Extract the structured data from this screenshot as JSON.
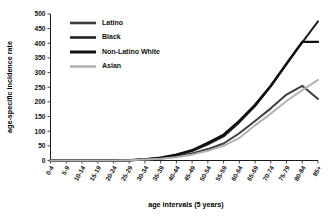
{
  "chart_data": {
    "type": "line",
    "title": "",
    "xlabel": "age intervals (5 years)",
    "ylabel": "age-specific incidence rate",
    "ylim": [
      0,
      500
    ],
    "ytick_step": 50,
    "yticks": [
      0,
      50,
      100,
      150,
      200,
      250,
      300,
      350,
      400,
      450,
      500
    ],
    "grid": false,
    "legend_position": "top-left-inside",
    "categories": [
      "0-4",
      "5-9",
      "10-14",
      "15-19",
      "20-24",
      "25-29",
      "30-34",
      "35-39",
      "40-44",
      "45-49",
      "50-54",
      "55-59",
      "60-64",
      "65-69",
      "70-74",
      "75-79",
      "80-84",
      "85+"
    ],
    "series": [
      {
        "name": "Latino",
        "color": "#3d3d3d",
        "width": 2.0,
        "values": [
          0,
          0,
          0,
          0,
          0,
          1,
          3,
          7,
          13,
          24,
          39,
          58,
          93,
          135,
          178,
          225,
          255,
          210
        ]
      },
      {
        "name": "Black",
        "color": "#1f1f1f",
        "width": 2.0,
        "values": [
          0,
          0,
          0,
          0,
          0,
          1,
          4,
          9,
          18,
          32,
          55,
          82,
          130,
          186,
          253,
          330,
          403,
          475
        ]
      },
      {
        "name": "Non-Latino White",
        "color": "#111111",
        "width": 2.4,
        "values": [
          0,
          0,
          0,
          0,
          0,
          1,
          4,
          10,
          20,
          35,
          60,
          88,
          135,
          190,
          255,
          330,
          405,
          405
        ]
      },
      {
        "name": "Asian",
        "color": "#b3b3b3",
        "width": 2.0,
        "values": [
          0,
          0,
          0,
          0,
          0,
          1,
          3,
          6,
          11,
          20,
          33,
          50,
          77,
          120,
          160,
          203,
          240,
          275
        ]
      }
    ]
  },
  "legend": {
    "items": [
      {
        "label": "Latino"
      },
      {
        "label": "Black"
      },
      {
        "label": "Non-Latino White"
      },
      {
        "label": "Asian"
      }
    ]
  }
}
